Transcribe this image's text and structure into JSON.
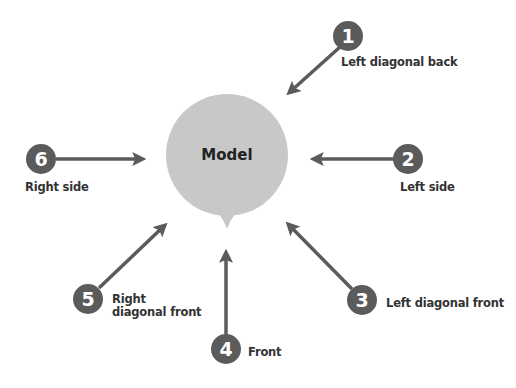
{
  "center": {
    "label": "Model",
    "color": "#c8c8c8"
  },
  "colors": {
    "arrow": "#5b5b5b",
    "badge": "#5b5b5b",
    "badge_text": "#ffffff",
    "label": "#333333"
  },
  "views": [
    {
      "number": "1",
      "label": "Left diagonal back"
    },
    {
      "number": "2",
      "label": "Left side"
    },
    {
      "number": "3",
      "label": "Left diagonal front"
    },
    {
      "number": "4",
      "label": "Front"
    },
    {
      "number": "5",
      "label": "Right diagonal front"
    },
    {
      "number": "6",
      "label": "Right side"
    }
  ]
}
